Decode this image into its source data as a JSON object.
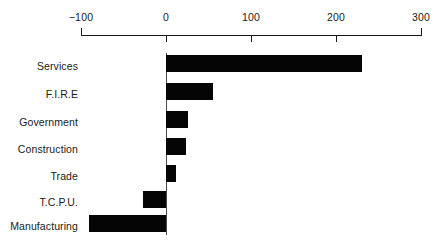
{
  "chart_data": {
    "type": "bar",
    "orientation": "horizontal",
    "title": "",
    "xlabel": "",
    "ylabel": "",
    "xlim": [
      -100,
      300
    ],
    "xticks": [
      -100,
      0,
      100,
      200,
      300
    ],
    "xticklabels": [
      "−100",
      "0",
      "100",
      "200",
      "300"
    ],
    "grid": false,
    "legend": false,
    "bar_color": "#050505",
    "axis_color": "#1a1a1a",
    "categories": [
      "Services",
      "F.I.R.E",
      "Government",
      "Construction",
      "Trade",
      "T.C.P.U.",
      "Manufacturing"
    ],
    "values": [
      230,
      55,
      26,
      23,
      12,
      -27,
      -91
    ]
  }
}
